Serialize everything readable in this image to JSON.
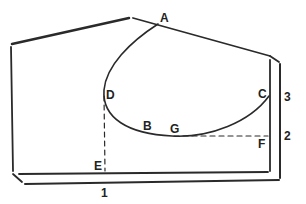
{
  "diagram": {
    "points": {
      "A": "A",
      "B": "B",
      "C": "C",
      "D": "D",
      "E": "E",
      "F": "F",
      "G": "G"
    },
    "dimensions": {
      "d1": "1",
      "d2": "2",
      "d3": "3"
    },
    "colors": {
      "stroke": "#2a2a2a",
      "background": "#ffffff"
    }
  }
}
